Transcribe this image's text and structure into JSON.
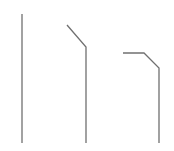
{
  "canvas": {
    "width": 174,
    "height": 151,
    "background": "#ffffff"
  },
  "stroke": {
    "color": "#707070",
    "width": 1.3
  },
  "paths": [
    {
      "name": "straight-line",
      "points": "22,14 22,143"
    },
    {
      "name": "single-bend-line",
      "points": "67,25 86,47 86,143"
    },
    {
      "name": "double-bend-line",
      "points": "123,53 144,53 159,68 159,143"
    }
  ]
}
